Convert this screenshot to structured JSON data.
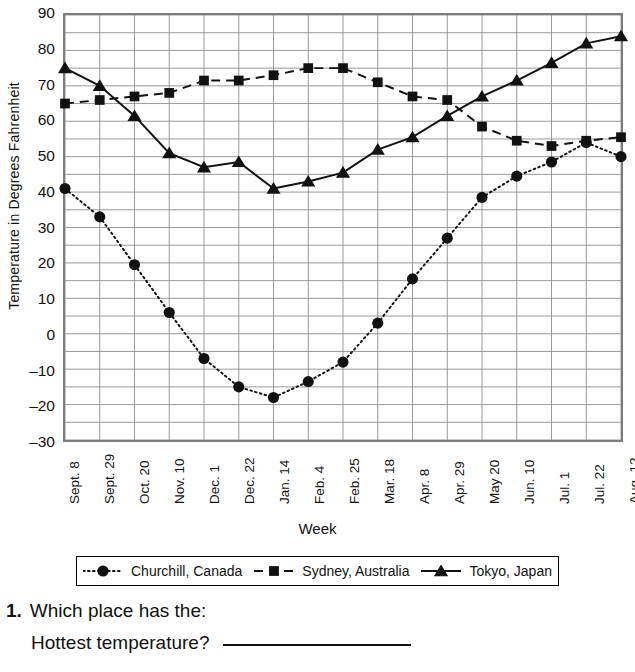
{
  "chart_data": {
    "type": "line",
    "title": "",
    "xlabel": "Week",
    "ylabel": "Temperature in Degrees Fahrenheit",
    "ylim": [
      -30,
      90
    ],
    "ytick_step": 10,
    "yminor_step": 5,
    "grid": true,
    "legend_position": "below",
    "yticks": [
      90,
      80,
      70,
      60,
      50,
      40,
      30,
      20,
      10,
      0,
      -10,
      -20,
      -30
    ],
    "categories": [
      "Sept. 8",
      "Sept. 29",
      "Oct. 20",
      "Nov. 10",
      "Dec. 1",
      "Dec. 22",
      "Jan. 14",
      "Feb. 4",
      "Feb. 25",
      "Mar. 18",
      "Apr. 8",
      "Apr. 29",
      "May 20",
      "Jun. 10",
      "Jul. 1",
      "Jul. 22",
      "Aug. 12"
    ],
    "series": [
      {
        "name": "Churchill, Canada",
        "marker": "circle",
        "line": "dotted",
        "color": "#111111",
        "values": [
          41,
          33,
          19.5,
          6,
          -7,
          -15,
          -18,
          -13.5,
          -8,
          3,
          15.5,
          27,
          38.5,
          44.5,
          48.5,
          54,
          50
        ]
      },
      {
        "name": "Sydney, Australia",
        "marker": "square",
        "line": "dashed",
        "color": "#111111",
        "values": [
          65,
          66,
          67,
          68,
          71.5,
          71.5,
          73,
          75,
          75,
          71,
          67,
          66,
          58.5,
          54.5,
          53,
          54.5,
          55.5
        ]
      },
      {
        "name": "Tokyo, Japan",
        "marker": "triangle",
        "line": "solid",
        "color": "#111111",
        "values": [
          75,
          70,
          61.5,
          51,
          47,
          48.5,
          41,
          43,
          45.5,
          52,
          55.5,
          61.5,
          67,
          71.5,
          76.5,
          82,
          84
        ]
      }
    ]
  },
  "legend": {
    "entries": [
      {
        "label": "Churchill, Canada",
        "key": "dotted-circle-key"
      },
      {
        "label": "Sydney, Australia",
        "key": "dashed-square-key"
      },
      {
        "label": "Tokyo, Japan",
        "key": "solid-triangle-key"
      }
    ]
  },
  "questions": [
    {
      "number": "1.",
      "prompt": "Which place has the:",
      "sub": "Hottest temperature?"
    }
  ]
}
